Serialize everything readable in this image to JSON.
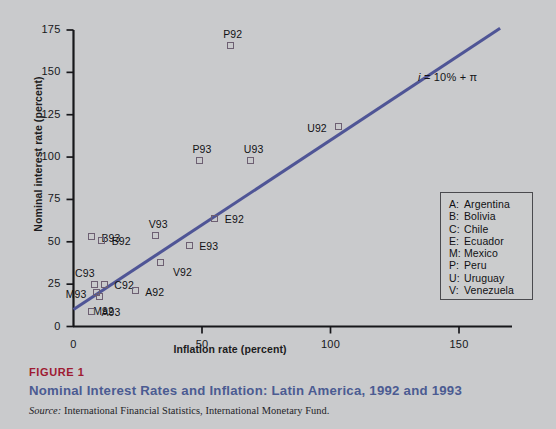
{
  "chart_data": {
    "type": "scatter",
    "title": "Nominal Interest Rates and Inflation: Latin America, 1992 and 1993",
    "xlabel": "Inflation rate (percent)",
    "ylabel": "Nominal interest rate (percent)",
    "xlim": [
      0,
      175
    ],
    "ylim": [
      0,
      178
    ],
    "xticks": [
      0,
      50,
      100,
      150
    ],
    "yticks": [
      0,
      25,
      50,
      75,
      100,
      125,
      150,
      175
    ],
    "grid": false,
    "legend_position": "inside-right",
    "marker_color": "#6d5f72",
    "line_color": "#4f5596",
    "annotation": "i = 10% + π",
    "annotation_equation": {
      "lhs": "i",
      "rhs": " = 10% + π"
    },
    "reference_line": {
      "intercept": 10,
      "slope": 1,
      "x_start": 0,
      "x_end": 175
    },
    "points": [
      {
        "label": "P92",
        "x": 61,
        "y": 166,
        "label_pos": "above"
      },
      {
        "label": "P93",
        "x": 49,
        "y": 98,
        "label_pos": "above"
      },
      {
        "label": "U93",
        "x": 69,
        "y": 98,
        "label_pos": "above"
      },
      {
        "label": "U92",
        "x": 103,
        "y": 118,
        "label_pos": "left"
      },
      {
        "label": "E92",
        "x": 55,
        "y": 64,
        "label_pos": "right"
      },
      {
        "label": "B93",
        "x": 7,
        "y": 53,
        "label_pos": "right"
      },
      {
        "label": "V93",
        "x": 32,
        "y": 54,
        "label_pos": "above"
      },
      {
        "label": "B92",
        "x": 11,
        "y": 51,
        "label_pos": "right"
      },
      {
        "label": "E93",
        "x": 45,
        "y": 48,
        "label_pos": "right"
      },
      {
        "label": "V92",
        "x": 34,
        "y": 38,
        "label_pos": "right-low"
      },
      {
        "label": "C93",
        "x": 8,
        "y": 25,
        "label_pos": "above-left"
      },
      {
        "label": "C92",
        "x": 12,
        "y": 25,
        "label_pos": "right"
      },
      {
        "label": "M93",
        "x": 9,
        "y": 20,
        "label_pos": "left"
      },
      {
        "label": "M92",
        "x": 10,
        "y": 18,
        "label_pos": "below"
      },
      {
        "label": "A92",
        "x": 24,
        "y": 21,
        "label_pos": "right"
      },
      {
        "label": "A93",
        "x": 7,
        "y": 9,
        "label_pos": "right"
      }
    ],
    "legend": [
      {
        "key": "A:",
        "name": "Argentina"
      },
      {
        "key": "B:",
        "name": "Bolivia"
      },
      {
        "key": "C:",
        "name": "Chile"
      },
      {
        "key": "E:",
        "name": "Ecuador"
      },
      {
        "key": "M:",
        "name": "Mexico"
      },
      {
        "key": "P:",
        "name": "Peru"
      },
      {
        "key": "U:",
        "name": "Uruguay"
      },
      {
        "key": "V:",
        "name": "Venezuela"
      }
    ]
  },
  "caption": {
    "figure_label": "FIGURE 1",
    "figure_title": "Nominal Interest Rates and Inflation: Latin America, 1992 and 1993",
    "source_prefix": "Source:",
    "source_text": " International Financial Statistics, International Monetary Fund."
  }
}
